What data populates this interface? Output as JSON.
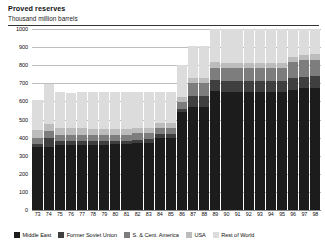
{
  "header": {
    "title": "Proved reserves",
    "subtitle": "Thousand million barrels"
  },
  "legend": {
    "items": [
      {
        "label": "Middle East",
        "color": "#1c1c1c"
      },
      {
        "label": "Former Soviet Union",
        "color": "#3f3f3f"
      },
      {
        "label": "S. & Cent. America",
        "color": "#7d7d7d"
      },
      {
        "label": "USA",
        "color": "#bcbcbc"
      },
      {
        "label": "Rest of World",
        "color": "#dcdcdc"
      }
    ]
  },
  "chart_data": {
    "type": "bar",
    "stacked": true,
    "title": "Proved reserves",
    "subtitle": "Thousand million barrels",
    "xlabel": "",
    "ylabel": "Thousand million barrels",
    "ylim": [
      0,
      1000
    ],
    "yticks": [
      0,
      100,
      200,
      300,
      400,
      500,
      600,
      700,
      800,
      900,
      1000
    ],
    "ytick_labels": [
      "0",
      "100",
      "200",
      "300",
      "400",
      "500",
      "600",
      "700",
      "800",
      "900",
      "1000"
    ],
    "grid": true,
    "legend_position": "bottom",
    "categories": [
      "73",
      "74",
      "75",
      "76",
      "77",
      "78",
      "79",
      "80",
      "81",
      "82",
      "83",
      "84",
      "85",
      "86",
      "87",
      "88",
      "89",
      "90",
      "91",
      "92",
      "93",
      "94",
      "95",
      "96",
      "97",
      "98"
    ],
    "series": [
      {
        "name": "Middle East",
        "color": "#1c1c1c",
        "values": [
          350,
          350,
          360,
          360,
          360,
          360,
          360,
          362,
          362,
          369,
          370,
          398,
          398,
          540,
          570,
          570,
          660,
          660,
          661,
          661,
          661,
          661,
          661,
          665,
          672,
          675
        ]
      },
      {
        "name": "Former Soviet Union",
        "color": "#3f3f3f",
        "values": [
          15,
          50,
          20,
          20,
          20,
          20,
          20,
          20,
          20,
          20,
          20,
          20,
          20,
          20,
          60,
          60,
          60,
          60,
          60,
          60,
          60,
          60,
          60,
          65,
          65,
          65
        ]
      },
      {
        "name": "S. & Cent. America",
        "color": "#7d7d7d",
        "values": [
          35,
          35,
          35,
          35,
          35,
          35,
          35,
          35,
          35,
          35,
          35,
          35,
          35,
          35,
          70,
          70,
          70,
          70,
          70,
          70,
          70,
          70,
          70,
          88,
          90,
          90
        ]
      },
      {
        "name": "USA",
        "color": "#bcbcbc",
        "values": [
          40,
          40,
          39,
          38,
          36,
          34,
          33,
          32,
          31,
          30,
          30,
          30,
          30,
          30,
          30,
          30,
          30,
          30,
          30,
          30,
          30,
          30,
          30,
          30,
          30,
          30
        ]
      },
      {
        "name": "Rest of World",
        "color": "#dcdcdc",
        "values": [
          170,
          220,
          196,
          192,
          199,
          201,
          202,
          201,
          202,
          196,
          195,
          167,
          167,
          175,
          175,
          175,
          185,
          190,
          189,
          189,
          189,
          189,
          189,
          152,
          143,
          140
        ]
      }
    ],
    "totals": [
      610,
      695,
      650,
      645,
      650,
      650,
      650,
      650,
      650,
      650,
      650,
      650,
      650,
      800,
      905,
      905,
      1005,
      1010,
      1010,
      1010,
      1010,
      1010,
      1010,
      1000,
      1000,
      1000
    ]
  }
}
